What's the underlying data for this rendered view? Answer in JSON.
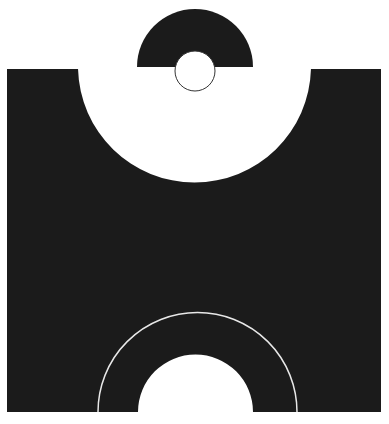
{
  "canvas": {
    "width": 389,
    "height": 424,
    "background": "#ffffff"
  },
  "colors": {
    "shape": "#1b1b1b",
    "hole": "#ffffff",
    "line": "#e8e8e8",
    "outline": "#333333"
  },
  "main_block": {
    "x": 7,
    "y": 69,
    "width": 374,
    "height": 343
  },
  "top_notch": {
    "cx": 194.5,
    "cy": 72,
    "r": 116.5
  },
  "top_semicircle": {
    "cx": 195,
    "cy": 67,
    "r": 58
  },
  "small_circle": {
    "cx": 195,
    "cy": 71,
    "r": 20
  },
  "bottom_arch_inner": {
    "cx": 195.5,
    "cy": 412,
    "r": 57.5
  },
  "bottom_arc_line": {
    "cx": 197.5,
    "cy": 412,
    "r": 99.5
  }
}
